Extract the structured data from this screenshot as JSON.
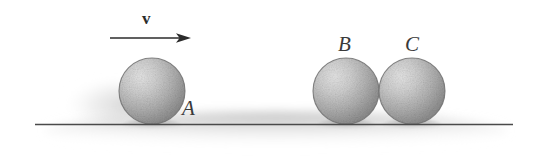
{
  "figure": {
    "background_color": "#ffffff",
    "width": 541,
    "height": 163
  },
  "velocity_arrow": {
    "label": "v",
    "label_x": 142,
    "label_y": 10,
    "x_start": 110,
    "x_end": 191,
    "y": 38,
    "color": "#2b2b2b"
  },
  "ground": {
    "name": "ground-line",
    "x_start": 35,
    "x_end": 513,
    "y": 124,
    "color": "#4a4a4a",
    "shadow_color": "#c9c9c9"
  },
  "spheres": [
    {
      "label": "A",
      "cx": 152,
      "cy": 91,
      "r": 33,
      "label_x": 182,
      "label_y": 98,
      "fill_light": "#d8d8d8",
      "fill_dark": "#8f8f8f",
      "outline": "#6b6b6b"
    },
    {
      "label": "B",
      "cx": 346,
      "cy": 91,
      "r": 33,
      "label_x": 338,
      "label_y": 34,
      "fill_light": "#d8d8d8",
      "fill_dark": "#8f8f8f",
      "outline": "#6b6b6b"
    },
    {
      "label": "C",
      "cx": 412,
      "cy": 91,
      "r": 33,
      "label_x": 405,
      "label_y": 34,
      "fill_light": "#d8d8d8",
      "fill_dark": "#8f8f8f",
      "outline": "#6b6b6b"
    }
  ]
}
